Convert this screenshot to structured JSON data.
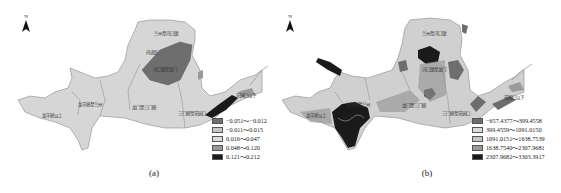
{
  "panels": [
    {
      "id": "a",
      "caption": "(a)",
      "north_label": "N",
      "legend": [
        {
          "label": "−0.051～−0.012",
          "color": "#6e6e6e"
        },
        {
          "label": "−0.011～0.015",
          "color": "#c8c8c8"
        },
        {
          "label": "0.016～0.047",
          "color": "#dcdcdc"
        },
        {
          "label": "0.048～0.120",
          "color": "#9a9a9a"
        },
        {
          "label": "0.121～0.212",
          "color": "#1a1a1a"
        }
      ],
      "region_labels": [
        "兰州至河口镇",
        "内流区",
        "河口镇至龙门",
        "龙羊峡至兰州",
        "龙羊峡以上",
        "龙门至三门峡",
        "三门峡至花园口",
        "花园口以下"
      ]
    },
    {
      "id": "b",
      "caption": "(b)",
      "north_label": "N",
      "legend": [
        {
          "label": "−657.4377～399.4558",
          "color": "#6e6e6e"
        },
        {
          "label": "399.4559～1091.0150",
          "color": "#dcdcdc"
        },
        {
          "label": "1091.0151～1638.7539",
          "color": "#c4c4c4"
        },
        {
          "label": "1638.7540～2307.9681",
          "color": "#9a9a9a"
        },
        {
          "label": "2307.9682～3303.3917",
          "color": "#1a1a1a"
        }
      ],
      "region_labels": [
        "兰州至河口镇",
        "河口镇至龙门",
        "龙羊峡至兰州",
        "龙羊峡以上",
        "龙门至三门峡",
        "三门峡至花园口",
        "花园口以下"
      ]
    }
  ]
}
